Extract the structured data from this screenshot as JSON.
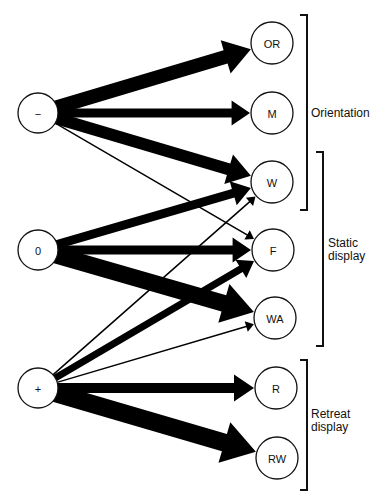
{
  "diagram": {
    "colors": {
      "ink": "#000000",
      "background": "#ffffff"
    },
    "source_nodes": [
      {
        "id": "neg",
        "label": "−",
        "x": 38,
        "y": 113,
        "r": 20
      },
      {
        "id": "zero",
        "label": "0",
        "x": 38,
        "y": 250,
        "r": 20
      },
      {
        "id": "pos",
        "label": "+",
        "x": 38,
        "y": 388,
        "r": 20
      }
    ],
    "target_nodes": [
      {
        "id": "OR",
        "label": "OR",
        "x": 272,
        "y": 43,
        "r": 21
      },
      {
        "id": "M",
        "label": "M",
        "x": 272,
        "y": 113,
        "r": 21
      },
      {
        "id": "W",
        "label": "W",
        "x": 272,
        "y": 182,
        "r": 21
      },
      {
        "id": "F",
        "label": "F",
        "x": 273,
        "y": 250,
        "r": 21
      },
      {
        "id": "WA",
        "label": "WA",
        "x": 275,
        "y": 318,
        "r": 21
      },
      {
        "id": "R",
        "label": "R",
        "x": 276,
        "y": 388,
        "r": 21
      },
      {
        "id": "RW",
        "label": "RW",
        "x": 277,
        "y": 458,
        "r": 21
      }
    ],
    "edges": [
      {
        "from": "neg",
        "to": "OR",
        "width": 14
      },
      {
        "from": "neg",
        "to": "M",
        "width": 9
      },
      {
        "from": "neg",
        "to": "W",
        "width": 12
      },
      {
        "from": "neg",
        "to": "F",
        "width": 1.5
      },
      {
        "from": "zero",
        "to": "W",
        "width": 9
      },
      {
        "from": "zero",
        "to": "F",
        "width": 9
      },
      {
        "from": "zero",
        "to": "WA",
        "width": 17
      },
      {
        "from": "pos",
        "to": "W",
        "width": 1.5
      },
      {
        "from": "pos",
        "to": "F",
        "width": 7
      },
      {
        "from": "pos",
        "to": "WA",
        "width": 1.5
      },
      {
        "from": "pos",
        "to": "R",
        "width": 10
      },
      {
        "from": "pos",
        "to": "RW",
        "width": 18
      }
    ],
    "groups": [
      {
        "id": "orientation",
        "lines": [
          "Orientation"
        ],
        "bracket_x": 307,
        "y1": 15,
        "y2": 210,
        "label_x": 311,
        "label_y": 113
      },
      {
        "id": "static-display",
        "lines": [
          "Static",
          "display"
        ],
        "bracket_x": 323,
        "y1": 152,
        "y2": 346,
        "label_x": 328,
        "label_y": 243
      },
      {
        "id": "retreat-display",
        "lines": [
          "Retreat",
          "display"
        ],
        "bracket_x": 307,
        "y1": 360,
        "y2": 490,
        "label_x": 311,
        "label_y": 414
      }
    ]
  }
}
